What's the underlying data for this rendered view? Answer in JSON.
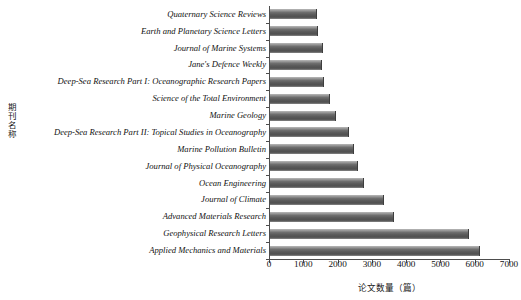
{
  "chart_data": {
    "type": "bar",
    "orientation": "horizontal",
    "title": "",
    "xlabel": "论文数量（篇）",
    "ylabel": "期刊名称",
    "xlim": [
      0,
      7000
    ],
    "xticks": [
      "0",
      "1000",
      "2000",
      "3000",
      "4000",
      "5000",
      "6000",
      "7000"
    ],
    "xtick_values": [
      0,
      1000,
      2000,
      3000,
      4000,
      5000,
      6000,
      7000
    ],
    "grid": false,
    "legend": "none",
    "bar_color": "#5a5a5a",
    "categories": [
      "Quaternary Science Reviews",
      "Earth and Planetary Science Letters",
      "Journal of Marine Systems",
      "Jane's Defence Weekly",
      "Deep-Sea Research Part I: Oceanographic Research Papers",
      "Science of the Total Environment",
      "Marine Geology",
      "Deep-Sea Research Part II: Topical Studies in Oceanography",
      "Marine Pollution Bulletin",
      "Journal of Physical Oceanography",
      "Ocean Engineering",
      "Journal of Climate",
      "Advanced Materials Research",
      "Geophysical Research Letters",
      "Applied Mechanics and Materials"
    ],
    "values": [
      1370,
      1400,
      1545,
      1515,
      1575,
      1750,
      1925,
      2300,
      2450,
      2570,
      2740,
      3320,
      3615,
      5800,
      6120
    ]
  }
}
